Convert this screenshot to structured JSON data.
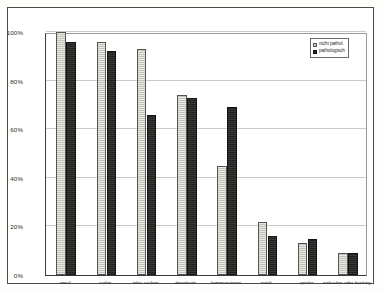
{
  "chart_data": {
    "type": "bar",
    "title": "",
    "xlabel": "",
    "ylabel": "",
    "ylim": [
      0,
      100
    ],
    "yticks": [
      "0%",
      "20%",
      "40%",
      "60%",
      "80%",
      "100%"
    ],
    "ytick_values": [
      0,
      20,
      40,
      60,
      80,
      100
    ],
    "grid": true,
    "legend_position": "top-right",
    "categories": [
      "email",
      "surfen",
      "infos suchen",
      "downloads",
      "kommunizieren",
      "erotik",
      "spielen",
      "einkaufen oder banking"
    ],
    "series": [
      {
        "name": "nicht pathol.",
        "color": "#cdcdc6",
        "values": [
          100,
          96,
          93,
          74,
          45,
          22,
          13,
          9
        ]
      },
      {
        "name": "pathologisch",
        "color": "#2b2b29",
        "values": [
          96,
          92,
          66,
          73,
          69,
          16,
          15,
          9
        ]
      }
    ]
  },
  "legend": {
    "items": [
      {
        "label": "nicht pathol."
      },
      {
        "label": "pathologisch"
      }
    ]
  }
}
